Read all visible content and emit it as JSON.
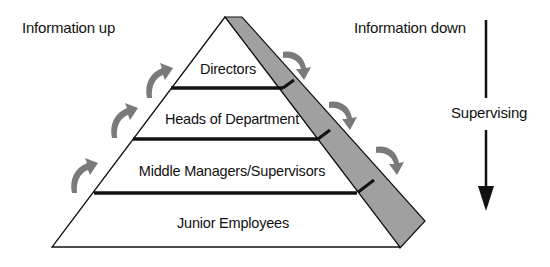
{
  "diagram": {
    "title_left": "Information up",
    "title_right": "Information down",
    "side_label": "Supervising",
    "tiers": [
      {
        "label": "Directors"
      },
      {
        "label": "Heads of Department"
      },
      {
        "label": "Middle Managers/Supervisors"
      },
      {
        "label": "Junior Employees"
      }
    ],
    "up_arrows_count": 4,
    "down_arrows_count": 3,
    "colors": {
      "outline": "#111111",
      "shaded_band": "#a0a0a0",
      "curved_arrows": "#7a7a7a",
      "background": "#ffffff"
    }
  }
}
